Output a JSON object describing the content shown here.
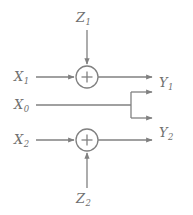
{
  "diagram": {
    "type": "signal-flow-block-diagram",
    "background_color": "#ffffff",
    "line_color": "#808080",
    "text_color": "#6f6f6f",
    "inputs": [
      {
        "id": "x1",
        "label": "X",
        "subscript": "1",
        "x": 18,
        "y": 77
      },
      {
        "id": "x0",
        "label": "X",
        "subscript": "0",
        "x": 18,
        "y": 105
      },
      {
        "id": "x2",
        "label": "X",
        "subscript": "2",
        "x": 18,
        "y": 140
      }
    ],
    "noise_inputs": [
      {
        "id": "z1",
        "label": "Z",
        "subscript": "1",
        "x": 80,
        "y": 18,
        "direction": "down"
      },
      {
        "id": "z2",
        "label": "Z",
        "subscript": "2",
        "x": 80,
        "y": 200,
        "direction": "up"
      }
    ],
    "outputs": [
      {
        "id": "y1",
        "label": "Y",
        "subscript": "1",
        "x": 160,
        "y": 83
      },
      {
        "id": "y2",
        "label": "Y",
        "subscript": "2",
        "x": 160,
        "y": 133
      }
    ],
    "adders": [
      {
        "id": "adder-top",
        "symbol": "+",
        "cx": 87,
        "cy": 77,
        "r": 11
      },
      {
        "id": "adder-bottom",
        "symbol": "+",
        "cx": 87,
        "cy": 140,
        "r": 11
      }
    ],
    "junction": {
      "id": "x0-branch",
      "x": 131,
      "y_top": 92,
      "y_bottom": 118,
      "y_mid": 105
    }
  }
}
